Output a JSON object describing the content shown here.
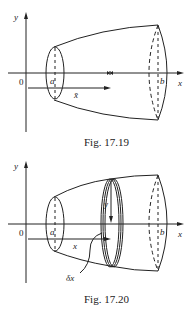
{
  "figures": [
    {
      "caption": "Fig. 17.19",
      "labels": {
        "y_axis": "y",
        "x_axis": "x",
        "origin": "0",
        "a": "a",
        "b": "b",
        "xbar": "x̄"
      }
    },
    {
      "caption": "Fig. 17.20",
      "labels": {
        "y_axis": "y",
        "x_axis": "x",
        "origin": "0",
        "a": "a",
        "b": "b",
        "x": "x",
        "y": "y",
        "dx": "δx"
      }
    }
  ],
  "colors": {
    "ink": "#222222",
    "background": "#ffffff"
  }
}
